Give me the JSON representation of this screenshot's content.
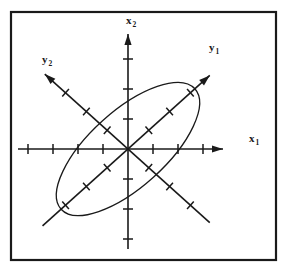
{
  "figure": {
    "kind": "coordinate-axes-diagram",
    "caption": "",
    "background_color": "#ffffff",
    "stroke_color": "#1a1a1a",
    "frame": {
      "name": "figure-border",
      "x": 11,
      "y": 12,
      "width": 265,
      "height": 248,
      "stroke_width": 2.2
    },
    "origin": {
      "x": 128,
      "y": 149
    }
  },
  "labels": {
    "x1": {
      "base": "x",
      "sub": "1",
      "x": 249,
      "y": 142
    },
    "x2": {
      "base": "x",
      "sub": "2",
      "x": 126,
      "y": 24
    },
    "y1": {
      "base": "y",
      "sub": "1",
      "x": 209,
      "y": 51
    },
    "y2": {
      "base": "y",
      "sub": "2",
      "x": 42,
      "y": 63
    }
  },
  "axes": [
    {
      "name": "axis-x1",
      "label": "x1",
      "angle_deg": 0,
      "neg_length": 110,
      "pos_length": 95,
      "arrow": "positive",
      "tick_spacing": 25,
      "tick_half_len": 5,
      "ticks_neg": 4,
      "ticks_pos": 3
    },
    {
      "name": "axis-x2",
      "label": "x2",
      "angle_deg": 90,
      "neg_length": 100,
      "pos_length": 115,
      "arrow": "positive",
      "tick_spacing": 30,
      "tick_half_len": 5,
      "ticks_neg": 3,
      "ticks_pos": 3
    },
    {
      "name": "axis-y1",
      "label": "y1",
      "angle_deg": 42,
      "neg_length": 115,
      "pos_length": 110,
      "arrow": "positive",
      "tick_spacing": 28,
      "tick_half_len": 5,
      "ticks_neg": 3,
      "ticks_pos": 3
    },
    {
      "name": "axis-y2",
      "label": "y2",
      "angle_deg": 138,
      "neg_length": 110,
      "pos_length": 112,
      "arrow": "positive",
      "tick_spacing": 28,
      "tick_half_len": 5,
      "ticks_neg": 3,
      "ticks_pos": 3
    }
  ],
  "ellipse": {
    "name": "tilted-ellipse",
    "center_x": 128,
    "center_y": 149,
    "semi_major": 90,
    "semi_minor": 38,
    "rotation_deg": -42,
    "stroke_width": 1.3,
    "fill": "none"
  }
}
